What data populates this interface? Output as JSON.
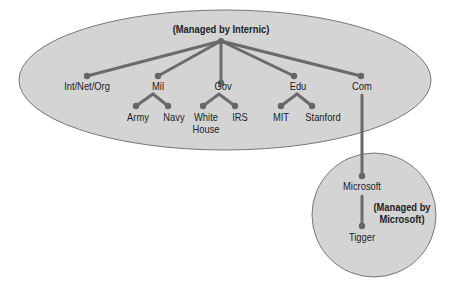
{
  "diagram": {
    "type": "dns-hierarchy",
    "root_label": "(Managed by Internic)",
    "top_level": [
      {
        "label": "Int/Net/Org",
        "children": []
      },
      {
        "label": "Mil",
        "children": [
          "Army",
          "Navy"
        ]
      },
      {
        "label": "Gov",
        "children": [
          "White House",
          "IRS"
        ]
      },
      {
        "label": "Edu",
        "children": [
          "MIT",
          "Stanford"
        ]
      },
      {
        "label": "Com",
        "children": [
          "Microsoft"
        ]
      }
    ],
    "sub_zone": {
      "label": "(Managed by Microsoft)",
      "line1": "(Managed by",
      "line2": "Microsoft)",
      "parent": "Microsoft",
      "child": "Tigger"
    },
    "labels": {
      "int": "Int/Net/Org",
      "mil": "Mil",
      "gov": "Gov",
      "edu": "Edu",
      "com": "Com",
      "army": "Army",
      "navy": "Navy",
      "white": "White",
      "house": "House",
      "irs": "IRS",
      "mit": "MIT",
      "stanford": "Stanford",
      "microsoft": "Microsoft",
      "tigger": "Tigger"
    },
    "colors": {
      "zone_fill": "#d4d4d4",
      "zone_stroke": "#777777",
      "line": "#6b6b6b",
      "node": "#666666"
    }
  }
}
